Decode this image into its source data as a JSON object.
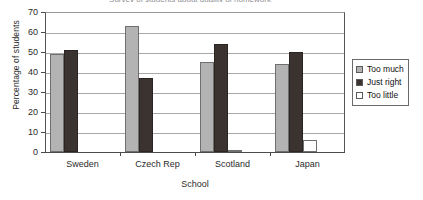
{
  "chart_data": {
    "type": "bar",
    "title": "Survey of students about quality of homework",
    "xlabel": "School",
    "ylabel": "Percentage of students",
    "categories": [
      "Sweden",
      "Czech Rep",
      "Scotland",
      "Japan"
    ],
    "series": [
      {
        "name": "Too much",
        "color": "#b3b3b3",
        "values": [
          49,
          63,
          45,
          44
        ]
      },
      {
        "name": "Just right",
        "color": "#3b3330",
        "values": [
          51,
          37,
          54,
          50
        ]
      },
      {
        "name": "Too little",
        "color": "#ffffff",
        "values": [
          0,
          0,
          1,
          6
        ]
      }
    ],
    "ylim": [
      0,
      70
    ],
    "ytick_step": 10,
    "yticks": [
      "70",
      "60",
      "50",
      "40",
      "30",
      "20",
      "10",
      "0"
    ],
    "grid": true,
    "legend_position": "right"
  },
  "legend": {
    "items": [
      {
        "label": "Too much",
        "swatch": "legend-swatch-too-much"
      },
      {
        "label": "Just right",
        "swatch": "legend-swatch-just-right"
      },
      {
        "label": "Too little",
        "swatch": "legend-swatch-too-little"
      }
    ]
  }
}
